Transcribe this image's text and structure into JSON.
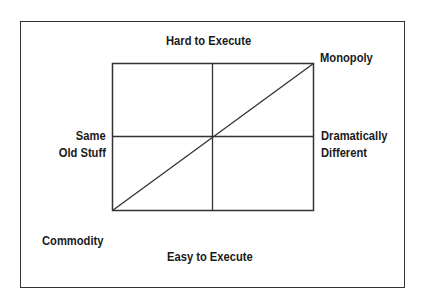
{
  "diagram": {
    "type": "2x2 matrix",
    "axes": {
      "y_top": "Hard to Execute",
      "y_bottom": "Easy to Execute",
      "x_left": "Same Old Stuff",
      "x_left_lines": [
        "Same",
        "Old Stuff"
      ],
      "x_right": "Dramatically Different",
      "x_right_lines": [
        "Dramatically",
        "Different"
      ]
    },
    "corners": {
      "top_right": "Monopoly",
      "bottom_left": "Commodity"
    },
    "diagonal": "Commodity to Monopoly",
    "colors": {
      "line": "#333333",
      "text": "#1a1a1a",
      "background": "#ffffff"
    }
  }
}
